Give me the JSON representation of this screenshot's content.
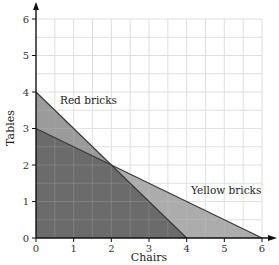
{
  "chart_data": {
    "type": "area",
    "title": "",
    "xlabel": "Chairs",
    "ylabel": "Tables",
    "xlim": [
      0,
      6
    ],
    "ylim": [
      0,
      6
    ],
    "x_ticks": [
      "0",
      "1",
      "2",
      "3",
      "4",
      "5",
      "6"
    ],
    "y_ticks": [
      "0",
      "1",
      "2",
      "3",
      "4",
      "5",
      "6"
    ],
    "grid": true,
    "grid_step": 0.5,
    "series": [
      {
        "name": "Red bricks",
        "boundary": [
          [
            0,
            4
          ],
          [
            4,
            0
          ]
        ],
        "equation": "x + y <= 4",
        "color": "#8a8a8a"
      },
      {
        "name": "Yellow bricks",
        "boundary": [
          [
            0,
            3
          ],
          [
            6,
            0
          ]
        ],
        "equation": "x + 2y <= 6",
        "color": "#9e9e9e"
      }
    ],
    "overlap_region": {
      "vertices": [
        [
          0,
          0
        ],
        [
          0,
          3
        ],
        [
          2,
          2
        ],
        [
          4,
          0
        ]
      ],
      "color": "#6b6b6b"
    },
    "intersection_point": [
      2,
      2
    ],
    "annotations": [
      {
        "text": "Red bricks",
        "x": 1.0,
        "y": 3.35
      },
      {
        "text": "Yellow bricks",
        "x": 5.0,
        "y": 1.3
      }
    ]
  }
}
